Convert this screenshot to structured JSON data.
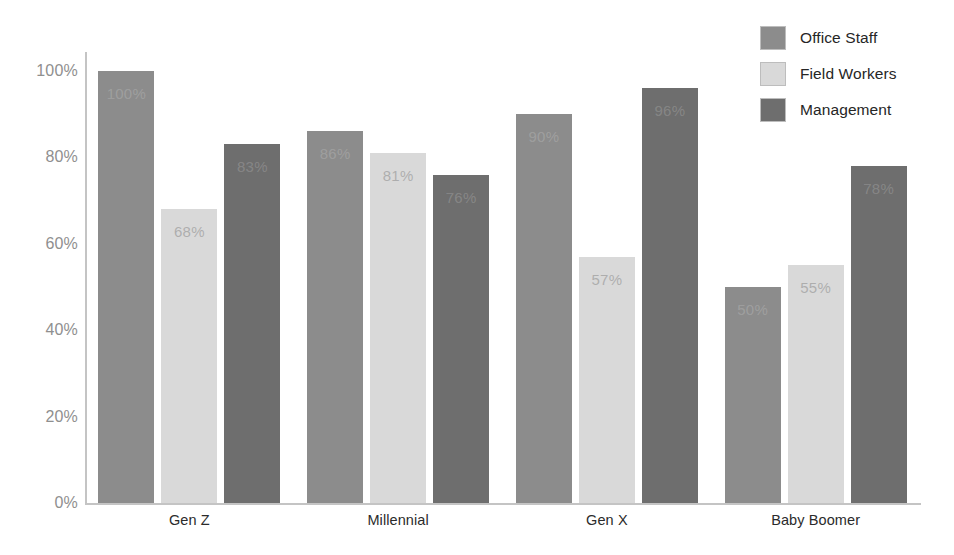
{
  "chart_data": {
    "type": "bar",
    "title": "",
    "subtitle": "",
    "xlabel": "",
    "ylabel": "",
    "ylim": [
      0,
      100
    ],
    "yticks": [
      "0%",
      "20%",
      "40%",
      "60%",
      "80%",
      "100%"
    ],
    "ytick_values": [
      0,
      20,
      40,
      60,
      80,
      100
    ],
    "grid": false,
    "legend_position": "top-right",
    "value_suffix": "%",
    "categories": [
      "Gen Z",
      "Millennial",
      "Gen X",
      "Baby Boomer"
    ],
    "series": [
      {
        "name": "Office Staff",
        "color": "#8c8c8c",
        "label_style": "on-dark",
        "values": [
          100,
          86,
          90,
          50
        ],
        "labels": [
          "100%",
          "86%",
          "90%",
          "50%"
        ]
      },
      {
        "name": "Field Workers",
        "color": "#d9d9d9",
        "label_style": "on-light",
        "values": [
          68,
          81,
          57,
          55
        ],
        "labels": [
          "68%",
          "81%",
          "57%",
          "55%"
        ]
      },
      {
        "name": "Management",
        "color": "#6e6e6e",
        "label_style": "on-dark",
        "values": [
          83,
          76,
          96,
          78
        ],
        "labels": [
          "83%",
          "76%",
          "96%",
          "78%"
        ]
      }
    ]
  },
  "axis_colors": {
    "axis_line": "#c4c4c4",
    "tick_text": "#8f8f8f",
    "category_text": "#2b2b2b",
    "background": "#ffffff"
  }
}
